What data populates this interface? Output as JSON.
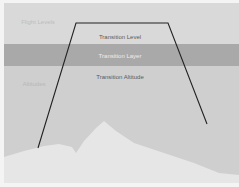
{
  "diagram": {
    "labels": {
      "flight_levels": "Flight Levels",
      "transition_level": "Transition Level",
      "transition_layer": "Transition Layer",
      "transition_altitude": "Transition Altitude",
      "altitudes": "Altitudes"
    },
    "colors": {
      "flight_level_band": "#d9d9d9",
      "transition_layer_band": "#a9a9a9",
      "altitude_band": "#cfcfcf",
      "terrain": "#e6e6e6",
      "flight_path": "#222222"
    }
  }
}
